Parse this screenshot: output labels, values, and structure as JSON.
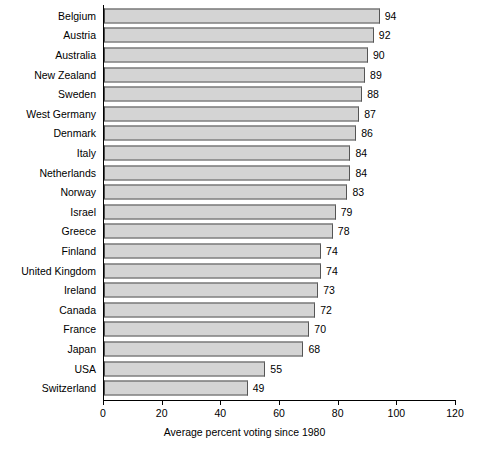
{
  "chart_data": {
    "type": "bar",
    "orientation": "horizontal",
    "title": "",
    "xlabel": "Average percent voting since 1980",
    "ylabel": "",
    "xlim": [
      0,
      120
    ],
    "xticks": [
      0,
      20,
      40,
      60,
      80,
      100,
      120
    ],
    "grid": false,
    "legend": null,
    "show_value_labels": true,
    "categories": [
      "Belgium",
      "Austria",
      "Australia",
      "New Zealand",
      "Sweden",
      "West Germany",
      "Denmark",
      "Italy",
      "Netherlands",
      "Norway",
      "Israel",
      "Greece",
      "Finland",
      "United Kingdom",
      "Ireland",
      "Canada",
      "France",
      "Japan",
      "USA",
      "Switzerland"
    ],
    "values": [
      94,
      92,
      90,
      89,
      88,
      87,
      86,
      84,
      84,
      83,
      79,
      78,
      74,
      74,
      73,
      72,
      70,
      68,
      55,
      49
    ]
  },
  "style": {
    "bar_fill": "#d4d4d4",
    "bar_border": "#555555",
    "axis_color": "#000000",
    "background": "#ffffff",
    "text_color": "#000000"
  },
  "footer": {
    "clipped_caption": ""
  }
}
